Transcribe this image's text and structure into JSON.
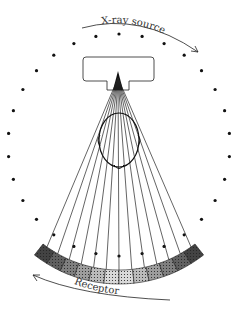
{
  "diagram": {
    "labels": {
      "source": "X-ray source",
      "receptor": "Receptor"
    },
    "ring_dot_count": 30,
    "beam_ray_count": 13,
    "receptor_segment_count": 12,
    "colors": {
      "ink": "#111111",
      "receptor_dark": "#333333",
      "receptor_light": "#e8e8e8"
    }
  }
}
